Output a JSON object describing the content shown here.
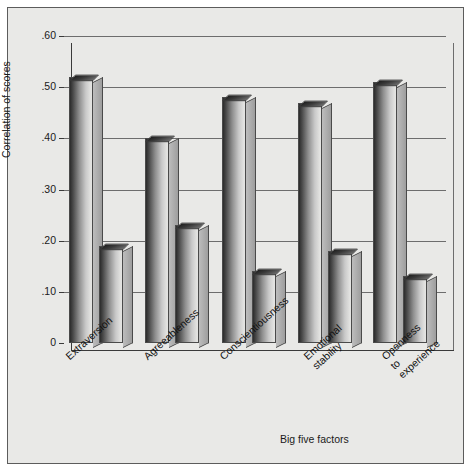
{
  "figure": {
    "background_color": "#e9e9e7",
    "frame_color": "#5c5c5c"
  },
  "chart_data": {
    "type": "bar",
    "title": "",
    "xlabel": "Big five factors",
    "ylabel": "Correlation of scores",
    "categories": [
      "Extraversion",
      "Agreeableness",
      "Conscientiousness",
      "Emotional stability",
      "Openness to experience"
    ],
    "category_lines": [
      [
        "Extraversion"
      ],
      [
        "Agreeableness"
      ],
      [
        "Conscientiousness"
      ],
      [
        "Emotional",
        "stability"
      ],
      [
        "Openness",
        "to",
        "experience"
      ]
    ],
    "series": [
      {
        "name": "series-1",
        "values": [
          0.52,
          0.4,
          0.48,
          0.47,
          0.51
        ]
      },
      {
        "name": "series-2",
        "values": [
          0.19,
          0.23,
          0.14,
          0.18,
          0.13
        ]
      }
    ],
    "ylim": [
      0,
      0.6
    ],
    "ytick_values": [
      0.6,
      0.5,
      0.4,
      0.3,
      0.2,
      0.1,
      0
    ],
    "ytick_labels": [
      ".60",
      ".50",
      ".40",
      ".30",
      ".20",
      ".10",
      "0"
    ],
    "grid": true,
    "legend": "none",
    "bar_style": "3d",
    "bar_colors": {
      "front_dark": "#2b2b2b",
      "front_light": "#e3e3e1",
      "top": "#2d2d2d",
      "side": "#a8a8a8"
    }
  }
}
